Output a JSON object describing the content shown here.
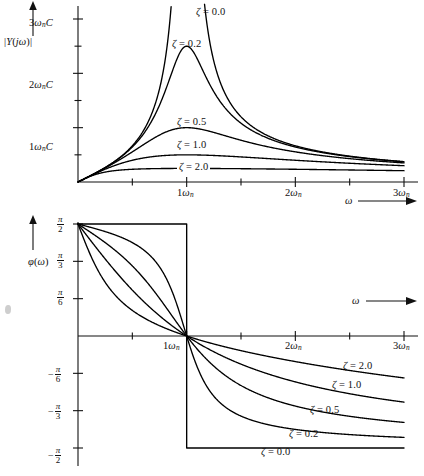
{
  "figure": {
    "kind": "two-panel frequency response plot",
    "panels": [
      {
        "id": "magnitude",
        "y_axis_label": "|Y(jω)|",
        "x_axis_label": "ω",
        "y_ticks": [
          "1ωₙC",
          "2ωₙC",
          "3ωₙC"
        ],
        "x_ticks": [
          "1ωₙ",
          "2ωₙ",
          "3ωₙ"
        ],
        "curve_labels": [
          "ζ = 0.0",
          "ζ = 0.2",
          "ζ = 0.5",
          "ζ = 1.0",
          "ζ = 2.0"
        ]
      },
      {
        "id": "phase",
        "y_axis_label": "φ(ω)",
        "x_axis_label": "ω",
        "y_ticks": [
          "π/2",
          "π/3",
          "π/6",
          "-π/6",
          "-π/3",
          "-π/2"
        ],
        "x_ticks": [
          "1ωₙ",
          "2ωₙ",
          "3ωₙ"
        ],
        "curve_labels": [
          "ζ = 2.0",
          "ζ = 1.0",
          "ζ = 0.5",
          "ζ = 0.2",
          "ζ = 0.0"
        ]
      }
    ]
  },
  "magnitude": {
    "y_axis_label_parts": {
      "bar1": "|",
      "Y": "Y",
      "open": "(",
      "j": "j",
      "omega": "ω",
      "close": ")",
      "bar2": "|"
    },
    "x_axis_label": "ω",
    "yticks": [
      {
        "value": 1,
        "num": "1",
        "omega": "ω",
        "sub": "n",
        "c": "C"
      },
      {
        "value": 2,
        "num": "2",
        "omega": "ω",
        "sub": "n",
        "c": "C"
      },
      {
        "value": 3,
        "num": "3",
        "omega": "ω",
        "sub": "n",
        "c": "C"
      }
    ],
    "xticks": [
      {
        "value": 1,
        "num": "1",
        "omega": "ω",
        "sub": "n"
      },
      {
        "value": 2,
        "num": "2",
        "omega": "ω",
        "sub": "n"
      },
      {
        "value": 3,
        "num": "3",
        "omega": "ω",
        "sub": "n"
      }
    ],
    "labels": [
      {
        "zeta": "ζ",
        "eq": "=",
        "val": "0.0"
      },
      {
        "zeta": "ζ",
        "eq": "=",
        "val": "0.2"
      },
      {
        "zeta": "ζ",
        "eq": "=",
        "val": "0.5"
      },
      {
        "zeta": "ζ",
        "eq": "=",
        "val": "1.0"
      },
      {
        "zeta": "ζ",
        "eq": "=",
        "val": "2.0"
      }
    ]
  },
  "phase": {
    "y_axis_label_parts": {
      "phi": "φ",
      "open": "(",
      "omega": "ω",
      "close": ")"
    },
    "x_axis_label": "ω",
    "yticks": [
      {
        "sign": "",
        "num": "π",
        "den": "2"
      },
      {
        "sign": "",
        "num": "π",
        "den": "3"
      },
      {
        "sign": "",
        "num": "π",
        "den": "6"
      },
      {
        "sign": "−",
        "num": "π",
        "den": "6"
      },
      {
        "sign": "−",
        "num": "π",
        "den": "3"
      },
      {
        "sign": "−",
        "num": "π",
        "den": "2"
      }
    ],
    "xticks": [
      {
        "value": 1,
        "num": "1",
        "omega": "ω",
        "sub": "n"
      },
      {
        "value": 2,
        "num": "2",
        "omega": "ω",
        "sub": "n"
      },
      {
        "value": 3,
        "num": "3",
        "omega": "ω",
        "sub": "n"
      }
    ],
    "labels": [
      {
        "zeta": "ζ",
        "eq": "=",
        "val": "2.0"
      },
      {
        "zeta": "ζ",
        "eq": "=",
        "val": "1.0"
      },
      {
        "zeta": "ζ",
        "eq": "=",
        "val": "0.5"
      },
      {
        "zeta": "ζ",
        "eq": "=",
        "val": "0.2"
      },
      {
        "zeta": "ζ",
        "eq": "=",
        "val": "0.0"
      }
    ]
  },
  "colors": {
    "ink": "#111111",
    "curve": "#000000",
    "background": "#ffffff"
  },
  "chart_data": {
    "type": "line",
    "title": "",
    "subplots": [
      {
        "id": "magnitude",
        "title": "",
        "xlabel": "ω",
        "ylabel": "|Y(jω)|",
        "xlim": [
          0,
          3
        ],
        "ylim": [
          0,
          3.6
        ],
        "xtick_values": [
          0.5,
          1,
          1.5,
          2,
          2.5,
          3
        ],
        "xtick_labels": [
          "",
          "1ωₙ",
          "",
          "2ωₙ",
          "",
          "3ωₙ"
        ],
        "ytick_values": [
          0.5,
          1,
          1.5,
          2,
          2.5,
          3
        ],
        "ytick_labels": [
          "",
          "1ωₙC",
          "",
          "2ωₙC",
          "",
          "3ωₙC"
        ],
        "grid": false,
        "legend": "inline-annotations",
        "note": "|Y(jω)| = ωₙC·r / sqrt((1-r²)² + (2ζr)²) with r = ω/ωₙ",
        "series": [
          {
            "name": "ζ = 0.0",
            "zeta": 0.0,
            "peak_x": 1.0,
            "peak_y": "∞ (asymptote)"
          },
          {
            "name": "ζ = 0.2",
            "zeta": 0.2,
            "peak_x": 1.0,
            "peak_y": 2.5
          },
          {
            "name": "ζ = 0.5",
            "zeta": 0.5,
            "peak_x": 1.0,
            "peak_y": 1.0
          },
          {
            "name": "ζ = 1.0",
            "zeta": 1.0,
            "peak_x": 1.0,
            "peak_y": 0.5
          },
          {
            "name": "ζ = 2.0",
            "zeta": 2.0,
            "peak_x": 1.0,
            "peak_y": 0.25
          }
        ]
      },
      {
        "id": "phase",
        "title": "",
        "xlabel": "ω",
        "ylabel": "φ(ω)",
        "xlim": [
          0,
          3
        ],
        "ylim": [
          -1.5708,
          1.5708
        ],
        "xtick_values": [
          0.5,
          1,
          1.5,
          2,
          2.5,
          3
        ],
        "xtick_labels": [
          "",
          "1ωₙ",
          "",
          "2ωₙ",
          "",
          "3ωₙ"
        ],
        "ytick_values": [
          1.5708,
          1.0472,
          0.5236,
          0,
          -0.5236,
          -1.0472,
          -1.5708
        ],
        "ytick_labels": [
          "π/2",
          "π/3",
          "π/6",
          "",
          "-π/6",
          "-π/3",
          "-π/2"
        ],
        "grid": false,
        "legend": "inline-annotations",
        "note": "φ(ω) = arctan((1-r²)/(2ζr)), r = ω/ωₙ; all curves pass through 0 at ω = 1ωₙ",
        "series": [
          {
            "name": "ζ = 0.0",
            "zeta": 0.0,
            "start_y": 1.5708,
            "end_y": -1.5708,
            "shape": "step at 1ωₙ"
          },
          {
            "name": "ζ = 0.2",
            "zeta": 0.2,
            "start_y": 1.5708,
            "end_y": -1.4
          },
          {
            "name": "ζ = 0.5",
            "zeta": 0.5,
            "start_y": 1.5708,
            "end_y": -1.1
          },
          {
            "name": "ζ = 1.0",
            "zeta": 1.0,
            "start_y": 1.5708,
            "end_y": -0.75
          },
          {
            "name": "ζ = 2.0",
            "zeta": 2.0,
            "start_y": 1.5708,
            "end_y": -0.45
          }
        ]
      }
    ]
  }
}
